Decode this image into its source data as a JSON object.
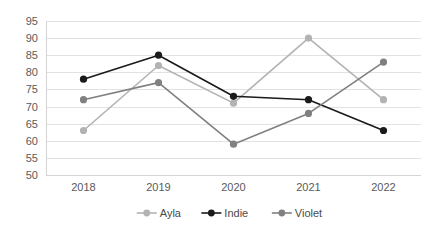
{
  "chart_data": {
    "type": "line",
    "title": "",
    "subtitle": "",
    "xlabel": "",
    "ylabel": "",
    "categories": [
      "2018",
      "2019",
      "2020",
      "2021",
      "2022"
    ],
    "series": [
      {
        "name": "Ayla",
        "color": "#b3b3b3",
        "marker": "circle",
        "values": [
          63,
          82,
          71,
          90,
          72
        ]
      },
      {
        "name": "Indie",
        "color": "#1a1a1a",
        "marker": "circle",
        "values": [
          78,
          85,
          73,
          72,
          63
        ]
      },
      {
        "name": "Violet",
        "color": "#808080",
        "marker": "circle",
        "values": [
          72,
          77,
          59,
          68,
          83
        ]
      }
    ],
    "ylim": [
      50,
      95
    ],
    "ytick_step": 5,
    "yticks": [
      50,
      55,
      60,
      65,
      70,
      75,
      80,
      85,
      90,
      95
    ],
    "grid": true,
    "grid_axis": "y",
    "legend_position": "bottom",
    "background": "#ffffff",
    "gridline_color": "#e2e2e2",
    "tick_label_color": "#5a5a5a"
  },
  "legend": {
    "items": [
      {
        "label": "Ayla"
      },
      {
        "label": "Indie"
      },
      {
        "label": "Violet"
      }
    ]
  }
}
